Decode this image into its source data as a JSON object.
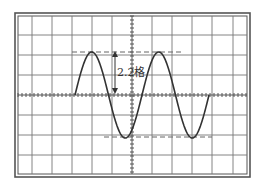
{
  "screen": {
    "type": "oscilloscope-screen",
    "frame_color": "#555555",
    "grid_color": "#666666",
    "trace_color": "#333333",
    "background": "#ffffff"
  },
  "grid": {
    "vertical_lines_x": [
      32,
      52,
      72,
      92,
      112,
      132,
      152,
      172,
      192,
      212,
      233
    ],
    "horizontal_lines_y": [
      35,
      55,
      75,
      95,
      115,
      135,
      155
    ],
    "center_x": 132,
    "center_y": 95,
    "minor_tick_spacing": 4
  },
  "waveform": {
    "shape": "sine",
    "start_x": 75,
    "end_x": 209,
    "baseline_y": 95,
    "amplitude_px": 43,
    "period_px": 67,
    "peaks": [
      [
        92,
        52
      ],
      [
        159,
        52
      ]
    ],
    "troughs": [
      [
        126,
        137
      ],
      [
        193,
        137
      ]
    ]
  },
  "annotations": {
    "top_dashed_line": {
      "y": 52,
      "x1": 72,
      "x2": 181
    },
    "bottom_dashed_line": {
      "y": 137,
      "x1": 104,
      "x2": 212
    },
    "amplitude_arrow": {
      "x": 115,
      "y1": 52,
      "y2": 93
    },
    "amplitude_label": "2.2格"
  }
}
